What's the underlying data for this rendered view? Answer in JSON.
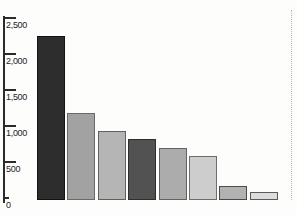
{
  "chart_data": {
    "type": "bar",
    "title": "",
    "xlabel": "",
    "ylabel": "",
    "categories": [
      "",
      "",
      "",
      "",
      "",
      "",
      "",
      ""
    ],
    "values": [
      2250,
      1180,
      930,
      820,
      700,
      580,
      170,
      80
    ],
    "ylim": [
      0,
      2500
    ],
    "grid": "off",
    "legend": "none",
    "yticks": [
      {
        "label": "2,500",
        "value": 2500
      },
      {
        "label": "2,000",
        "value": 2000
      },
      {
        "label": "1,500",
        "value": 1500
      },
      {
        "label": "1,000",
        "value": 1000
      },
      {
        "label": "500",
        "value": 500
      },
      {
        "label": "0",
        "value": 0
      }
    ],
    "bar_fill_colors": [
      "#2d2d2d",
      "#a2a2a2",
      "#b5b5b5",
      "#525252",
      "#acacac",
      "#cdcdcd",
      "#b2b2b2",
      "#dcdcdc"
    ],
    "bar_border_colors": [
      "#141414",
      "#6a6a6a",
      "#5f5f5f",
      "#2e2e2e",
      "#626262",
      "#6e6e6e",
      "#4a4a4a",
      "#5a5a5a"
    ],
    "axis_color": "#2b2b2b",
    "background_color": "#fdfdfc"
  }
}
